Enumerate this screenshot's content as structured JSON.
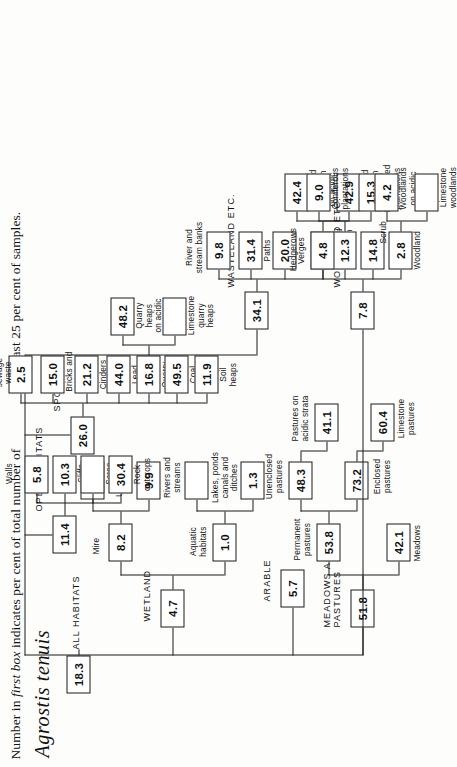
{
  "caption": {
    "line_left_html": "Number in <i>first box</i> indicates per cent of total number of",
    "line_right": "least 25 per cent of samples.",
    "species": "Agrostis tenuis"
  },
  "chart_data": {
    "type": "diagram",
    "title": "Agrostis tenuis",
    "subtitle": "Number in first box indicates per cent of total number of ... least 25 per cent of samples.",
    "root": {
      "label": "ALL HABITATS",
      "value": "18.3"
    },
    "nodes": {
      "all_habitats": "ALL HABITATS",
      "all_habitats_value": "18.3",
      "wetland": "WETLAND",
      "wetland_value": "4.7",
      "aquatic_habitats": "Aquatic\nhabitats",
      "aquatic_value": "1.0",
      "lakes_ponds": "Lakes, ponds\ncanals and\nditches",
      "lakes_value": "1.3",
      "rivers_streams": "Rivers and\nstreams",
      "rivers_value": "",
      "mire": "Mire",
      "mire_value": "8.2",
      "unshaded_mire": "Unshaded\nmire",
      "unshaded_value": "9.9",
      "shaded_mire": "Shaded\nmire",
      "shaded_value": "5.1",
      "arable": "ARABLE",
      "arable_value": "5.7",
      "meadows_pastures": "MEADOWS AND\nPASTURES",
      "meadows_pastures_value": "51.8",
      "meadows": "Meadows",
      "meadows_value": "42.1",
      "permanent_pastures": "Permanent\npastures",
      "permanent_pastures_value": "53.8",
      "enclosed_pastures": "Enclosed\npastures",
      "enclosed_pastures_value": "73.2",
      "unenclosed_pastures": "Unenclosed\npastures",
      "unenclosed_pastures_value": "48.3",
      "limestone_pastures": "Limestone\npastures",
      "limestone_pastures_value": "60.4",
      "pastures_acidic": "Pastures on\nacidic strata",
      "pastures_acidic_value": "41.1",
      "woodland_etc": "WOODLAND ETC.",
      "woodland_etc_value": "7.8",
      "woodland": "Woodland",
      "woodland_value": "2.8",
      "limestone_woodlands": "Limestone\nwoodlands",
      "limestone_woodlands_value": "",
      "woodlands_acidic": "Woodlands\non acidic\nstrata",
      "woodlands_acidic_value": "4.2",
      "scrub": "Scrub",
      "scrub_value": "14.8",
      "plantations_value": "12.3",
      "broadleaved_plantations": "Broadleaved\nplantations",
      "broadleaved_value": "15.3",
      "coniferous_plantations": "Coniferous\nplantations",
      "coniferous_value": "9.0",
      "hedgerows": "Hedgerows",
      "hedgerows_value": "4.8",
      "open_habitats": "OPEN HABITATS",
      "open_habitats_value": "11.4",
      "rock_outcrops": "Rock\noutcrops",
      "rock_outcrops_value": "30.4",
      "scree": "Scree",
      "scree_value": "",
      "cliffs": "Cliffs",
      "cliffs_value": "10.3",
      "walls": "Walls",
      "walls_value": "5.8",
      "spoil": "SPOIL",
      "spoil_value": "26.0",
      "soil_heaps": "Soil\nheaps",
      "soil_heaps_value": "11.9",
      "coal_mine_heaps": "Coal\nmine\nheaps",
      "coal_mine_heaps_value": "49.5",
      "quarry_heaps": "Quarry\nheaps",
      "quarry_heaps_value": "16.8",
      "limestone_quarry_heaps": "Limestone\nquarry\nheaps",
      "limestone_quarry_value": "",
      "quarry_heaps_acidic": "Quarry\nheaps\non acidic\nstrata",
      "quarry_heaps_acidic_value": "48.2",
      "lead_mine_heaps": "Lead\nmine\nheaps",
      "lead_mine_heaps_value": "44.0",
      "cinders": "Cinders",
      "cinders_value": "21.2",
      "bricks_mortar": "Bricks and\nmortar",
      "bricks_mortar_value": "15.0",
      "manure_sewage": "Manure and\nsewage\nwaste",
      "manure_sewage_value": "2.5",
      "wasteland_etc": "WASTELAND ETC.",
      "wasteland_etc_value": "34.1",
      "wasteland_heath": "Wasteland\nand heath",
      "wasteland_heath_value": "42.6",
      "wasteland_heath_limestone": "Wasteland\nand heath\non lime-\nstone",
      "wasteland_heath_limestone_value": "42.9",
      "wasteland_heath_acidic": "Wasteland\nand heath\non acidic\nstrata",
      "wasteland_heath_acidic_value": "42.4",
      "verges": "Verges",
      "verges_value": "20.0",
      "paths": "Paths",
      "paths_value": "31.4",
      "river_stream_banks": "River and\nstream banks",
      "river_stream_banks_value": "9.8"
    }
  }
}
